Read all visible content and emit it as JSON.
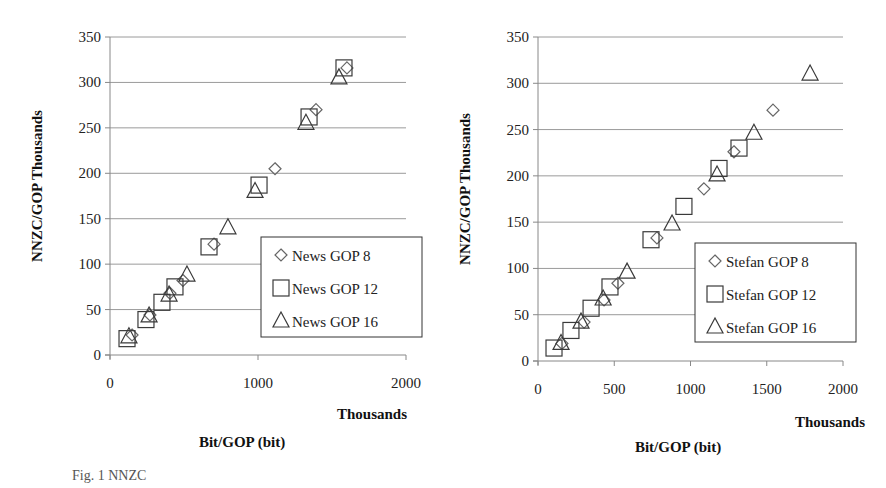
{
  "chart_data": [
    {
      "type": "scatter",
      "title": "",
      "xlabel": "Bit/GOP (bit)",
      "xunit": "Thousands",
      "ylabel": "NNZC/GOP Thousands",
      "xlim": [
        0,
        2000
      ],
      "ylim": [
        0,
        350
      ],
      "xticks": [
        "0",
        "1000",
        "2000"
      ],
      "xtick_values": [
        0,
        1000,
        2000
      ],
      "yticks": [
        "0",
        "50",
        "100",
        "150",
        "200",
        "250",
        "300",
        "350"
      ],
      "ytick_values": [
        0,
        50,
        100,
        150,
        200,
        250,
        300,
        350
      ],
      "grid": true,
      "legend": "center-right",
      "series": [
        {
          "name": "News GOP 8",
          "marker": "diamond",
          "x": [
            149,
            270,
            405,
            493,
            703,
            1115,
            1392,
            1601
          ],
          "y": [
            22,
            44,
            68,
            82,
            122,
            205,
            270,
            316
          ]
        },
        {
          "name": "News GOP 12",
          "marker": "square",
          "x": [
            115,
            243,
            351,
            439,
            669,
            1007,
            1345,
            1581
          ],
          "y": [
            18,
            39,
            58,
            75,
            119,
            187,
            262,
            316
          ]
        },
        {
          "name": "News GOP 16",
          "marker": "triangle",
          "x": [
            128,
            264,
            399,
            520,
            797,
            980,
            1324,
            1547
          ],
          "y": [
            20,
            43,
            66,
            88,
            140,
            180,
            255,
            305
          ]
        }
      ]
    },
    {
      "type": "scatter",
      "title": "",
      "xlabel": "Bit/GOP (bit)",
      "xunit": "Thousands",
      "ylabel": "NNZC/GOP Thousands",
      "xlim": [
        0,
        2000
      ],
      "ylim": [
        0,
        350
      ],
      "xticks": [
        "0",
        "500",
        "1000",
        "1500",
        "2000"
      ],
      "xtick_values": [
        0,
        500,
        1000,
        1500,
        2000
      ],
      "yticks": [
        "0",
        "50",
        "100",
        "150",
        "200",
        "250",
        "300",
        "350"
      ],
      "ytick_values": [
        0,
        50,
        100,
        150,
        200,
        250,
        300,
        350
      ],
      "grid": true,
      "legend": "center-right",
      "series": [
        {
          "name": "Stefan GOP 8",
          "marker": "diamond",
          "x": [
            157,
            302,
            433,
            524,
            780,
            1088,
            1285,
            1541
          ],
          "y": [
            19,
            42,
            66,
            84,
            133,
            186,
            226,
            271
          ]
        },
        {
          "name": "Stefan GOP 12",
          "marker": "square",
          "x": [
            105,
            216,
            348,
            472,
            741,
            957,
            1187,
            1318
          ],
          "y": [
            14,
            33,
            57,
            80,
            131,
            167,
            208,
            230
          ]
        },
        {
          "name": "Stefan GOP 16",
          "marker": "triangle",
          "x": [
            151,
            282,
            427,
            584,
            879,
            1174,
            1416,
            1784
          ],
          "y": [
            19,
            42,
            67,
            96,
            148,
            201,
            246,
            310
          ]
        }
      ]
    }
  ],
  "caption": "Fig. 1 NNZC"
}
